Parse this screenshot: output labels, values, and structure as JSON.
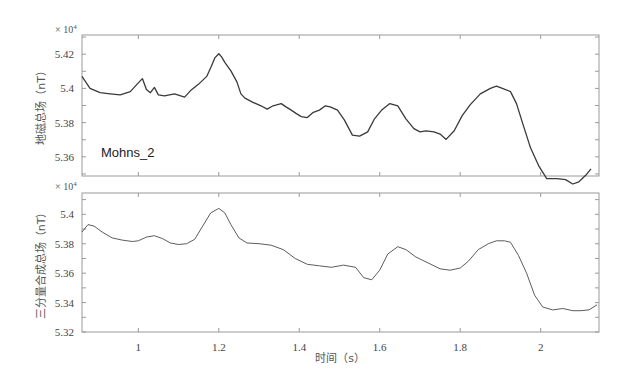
{
  "chart_data": [
    {
      "type": "line",
      "title": "",
      "xlabel": "",
      "ylabel": "地磁总场（nT）",
      "y_multiplier": "× 10⁴",
      "annotation": "Mohns_2",
      "xlim": [
        0.86,
        2.145
      ],
      "ylim": [
        5.3488,
        5.4312
      ],
      "xticks": [
        1,
        1.2,
        1.4,
        1.6,
        1.8,
        2
      ],
      "xtick_labels": [
        "",
        "",
        "",
        "",
        "",
        ""
      ],
      "yticks": [
        5.36,
        5.38,
        5.4,
        5.42
      ],
      "ytick_labels": [
        "5.36",
        "5.38",
        "5.4",
        "5.42"
      ],
      "grid": false,
      "series": [
        {
          "name": "地磁总场",
          "color": "#3a3a3a",
          "x": [
            0.86,
            0.88,
            0.905,
            0.93,
            0.955,
            0.98,
            1.0,
            1.01,
            1.02,
            1.03,
            1.04,
            1.05,
            1.065,
            1.09,
            1.115,
            1.13,
            1.15,
            1.17,
            1.18,
            1.19,
            1.2,
            1.207,
            1.215,
            1.23,
            1.245,
            1.255,
            1.265,
            1.285,
            1.305,
            1.32,
            1.335,
            1.355,
            1.367,
            1.38,
            1.392,
            1.405,
            1.42,
            1.435,
            1.45,
            1.465,
            1.477,
            1.495,
            1.512,
            1.532,
            1.55,
            1.57,
            1.587,
            1.605,
            1.625,
            1.645,
            1.665,
            1.685,
            1.7,
            1.715,
            1.735,
            1.75,
            1.765,
            1.785,
            1.805,
            1.825,
            1.85,
            1.875,
            1.89,
            1.905,
            1.925,
            1.94,
            1.955,
            1.975,
            1.995,
            2.015,
            2.04,
            2.062,
            2.08,
            2.095,
            2.112,
            2.125
          ],
          "y": [
            5.407,
            5.4,
            5.3975,
            5.3968,
            5.3962,
            5.3981,
            5.4032,
            5.4057,
            5.3994,
            5.3975,
            5.4006,
            5.3962,
            5.3956,
            5.3968,
            5.3949,
            5.3987,
            5.4025,
            5.407,
            5.4121,
            5.4178,
            5.4203,
            5.4184,
            5.4152,
            5.4102,
            5.4038,
            5.3968,
            5.3943,
            5.3918,
            5.3898,
            5.3879,
            5.3898,
            5.3911,
            5.3892,
            5.3873,
            5.3854,
            5.3835,
            5.3829,
            5.386,
            5.3873,
            5.3898,
            5.3892,
            5.3873,
            5.3816,
            5.3727,
            5.3721,
            5.3746,
            5.3822,
            5.3873,
            5.3911,
            5.3898,
            5.3822,
            5.3765,
            5.3746,
            5.3752,
            5.3746,
            5.3733,
            5.3702,
            5.3752,
            5.3841,
            5.3905,
            5.3968,
            5.4,
            5.4013,
            5.4,
            5.3981,
            5.3911,
            5.3797,
            5.3651,
            5.3549,
            5.3473,
            5.3473,
            5.3467,
            5.3441,
            5.3454,
            5.3492,
            5.353
          ]
        }
      ]
    },
    {
      "type": "line",
      "title": "",
      "xlabel": "时间（s）",
      "ylabel": "三分量合成总场（nT）",
      "y_multiplier": "× 10⁴",
      "xlim": [
        0.86,
        2.145
      ],
      "ylim": [
        5.32,
        5.4145
      ],
      "xticks": [
        1,
        1.2,
        1.4,
        1.6,
        1.8,
        2
      ],
      "xtick_labels": [
        "1",
        "1.2",
        "1.4",
        "1.6",
        "1.8",
        "2"
      ],
      "yticks": [
        5.32,
        5.34,
        5.36,
        5.38,
        5.4
      ],
      "ytick_labels": [
        "5.32",
        "5.34",
        "5.36",
        "5.38",
        "5.4"
      ],
      "grid": false,
      "series": [
        {
          "name": "三分量合成总场",
          "color": "#4a4a4a",
          "x": [
            0.86,
            0.875,
            0.89,
            0.91,
            0.935,
            0.96,
            0.985,
            1.0,
            1.02,
            1.04,
            1.06,
            1.08,
            1.1,
            1.12,
            1.14,
            1.16,
            1.18,
            1.2,
            1.215,
            1.23,
            1.25,
            1.27,
            1.3,
            1.33,
            1.36,
            1.39,
            1.42,
            1.45,
            1.48,
            1.51,
            1.54,
            1.56,
            1.58,
            1.6,
            1.62,
            1.645,
            1.665,
            1.69,
            1.72,
            1.75,
            1.775,
            1.8,
            1.82,
            1.845,
            1.87,
            1.89,
            1.91,
            1.925,
            1.945,
            1.965,
            1.985,
            2.005,
            2.03,
            2.055,
            2.08,
            2.1,
            2.12,
            2.14
          ],
          "y": [
            5.388,
            5.393,
            5.392,
            5.388,
            5.384,
            5.3825,
            5.3815,
            5.382,
            5.3845,
            5.3855,
            5.3835,
            5.3805,
            5.3795,
            5.38,
            5.383,
            5.392,
            5.401,
            5.404,
            5.401,
            5.393,
            5.384,
            5.3805,
            5.38,
            5.379,
            5.376,
            5.37,
            5.366,
            5.365,
            5.364,
            5.3655,
            5.364,
            5.357,
            5.3555,
            5.362,
            5.373,
            5.378,
            5.376,
            5.371,
            5.367,
            5.363,
            5.362,
            5.3635,
            5.368,
            5.376,
            5.38,
            5.382,
            5.382,
            5.381,
            5.372,
            5.36,
            5.345,
            5.337,
            5.335,
            5.336,
            5.3345,
            5.3345,
            5.335,
            5.3385
          ]
        }
      ]
    }
  ],
  "labels": {
    "top_ylabel": "地磁总场（nT）",
    "bottom_ylabel": "三分量合成总场（nT）",
    "xlabel": "时间（s）",
    "annotation": "Mohns_2",
    "multiplier_base": "× 10",
    "multiplier_exp": "4"
  }
}
